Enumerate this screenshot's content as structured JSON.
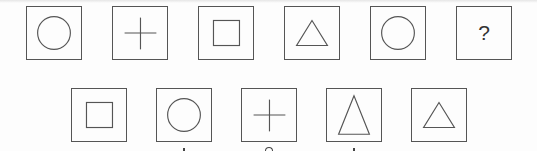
{
  "puzzle": {
    "sequence": [
      {
        "shape": "circle"
      },
      {
        "shape": "plus"
      },
      {
        "shape": "square"
      },
      {
        "shape": "triangle"
      },
      {
        "shape": "circle"
      },
      {
        "shape": "question",
        "text": "?"
      }
    ],
    "options": [
      {
        "shape": "square"
      },
      {
        "shape": "circle"
      },
      {
        "shape": "plus"
      },
      {
        "shape": "tall-triangle"
      },
      {
        "shape": "triangle"
      }
    ]
  },
  "colors": {
    "stroke": "#555555",
    "background": "#fdfdfd"
  }
}
